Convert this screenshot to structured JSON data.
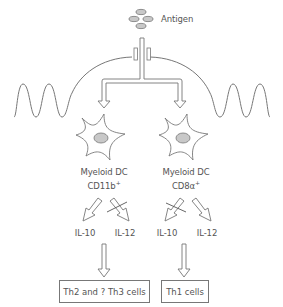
{
  "antigen": {
    "label": "Antigen"
  },
  "cells": [
    {
      "name": "Myeloid DC",
      "marker": "CD11b",
      "marker_sup": "+"
    },
    {
      "name": "Myeloid DC",
      "marker": "CD8α",
      "marker_sup": "+"
    }
  ],
  "cytokines": [
    {
      "left": "IL-10",
      "right": "IL-12",
      "blocked": "right"
    },
    {
      "left": "IL-10",
      "right": "IL-12",
      "blocked": "left"
    }
  ],
  "outcomes": [
    {
      "label": "Th2 and ? Th3 cells"
    },
    {
      "label": "Th1 cells"
    }
  ],
  "colors": {
    "stroke": "#777777",
    "fill_grey": "#c8c8c8",
    "text": "#555555"
  }
}
